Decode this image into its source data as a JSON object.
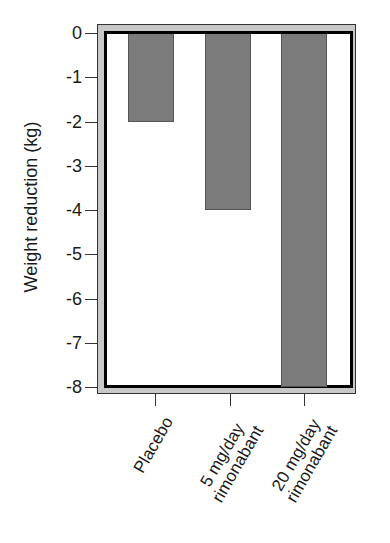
{
  "chart_data": {
    "type": "bar",
    "title": "",
    "xlabel": "",
    "ylabel": "Weight reduction (kg)",
    "categories": [
      "Placebo",
      "5 mg/day rimonabant",
      "20 mg/day rimonabant"
    ],
    "category_lines": [
      [
        "Placebo"
      ],
      [
        "5 mg/day",
        "rimonabant"
      ],
      [
        "20 mg/day",
        "rimonabant"
      ]
    ],
    "values": [
      -2,
      -4,
      -8
    ],
    "ylim": [
      -8,
      0
    ],
    "yticks": [
      "0",
      "-1",
      "-2",
      "-3",
      "-4",
      "-5",
      "-6",
      "-7",
      "-8"
    ],
    "grid": false,
    "legend": null,
    "colors": {
      "bar": "#7b7b7b",
      "frame_band": "#c8c8c8",
      "border": "#000000"
    }
  }
}
